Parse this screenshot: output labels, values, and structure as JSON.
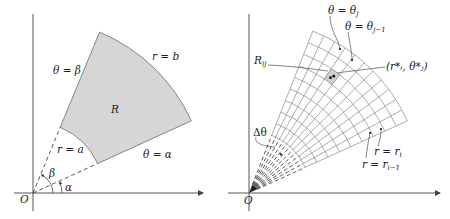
{
  "left_figure": {
    "origin_label": "O",
    "region_label": "R",
    "labels": {
      "theta_beta": "θ = β",
      "theta_alpha": "θ = α",
      "r_a": "r = a",
      "r_b": "r = b",
      "beta": "β",
      "alpha": "α"
    },
    "geometry": {
      "alpha_deg": 24.5,
      "beta_deg": 67.5,
      "a": 71,
      "b": 174
    },
    "colors": {
      "region_fill": "#d6d6d6",
      "stroke": "#555555",
      "axis": "#555555"
    }
  },
  "right_figure": {
    "origin_label": "O",
    "labels": {
      "theta_j": "θ = θ",
      "theta_j_sub": "j",
      "theta_j1": "θ = θ",
      "theta_j1_sub": "j−1",
      "R_ij": "R",
      "R_ij_sub": "ij",
      "sample_point": "(r*ᵢ, θ*ⱼ)",
      "delta_theta": "Δθ",
      "r_i": "r = r",
      "r_i_sub": "i",
      "r_i1": "r = r",
      "r_i1_sub": "i−1"
    },
    "geometry": {
      "alpha_deg": 24.5,
      "beta_deg": 68.5,
      "a": 62,
      "b": 174,
      "angular_divisions": 11,
      "radial_divisions": 9
    },
    "colors": {
      "grid": "#8a8a8a",
      "highlight_cell": "#cfcfcf",
      "axis": "#555555"
    }
  }
}
